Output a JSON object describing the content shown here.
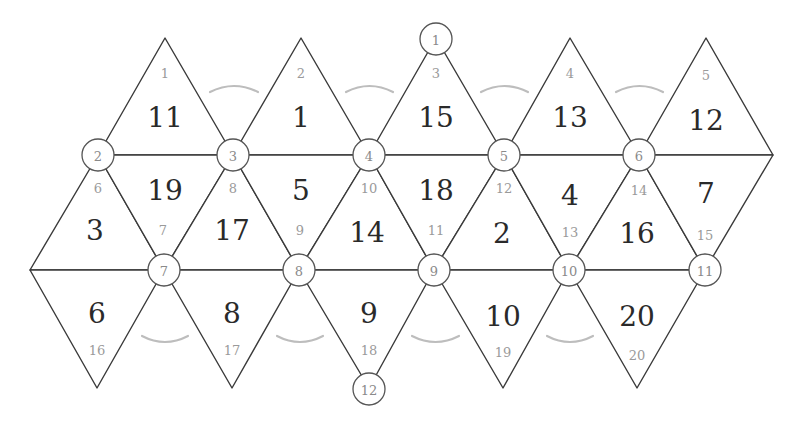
{
  "colors": {
    "edge": "#3a3a3a",
    "arc": "#bdbdbd",
    "face_label": "#2a2a2a",
    "index_label": "#9a9a9a",
    "vertex_label": "#8a8a8a"
  },
  "faces": [
    {
      "index": "1",
      "value": "11"
    },
    {
      "index": "2",
      "value": "1"
    },
    {
      "index": "3",
      "value": "15"
    },
    {
      "index": "4",
      "value": "13"
    },
    {
      "index": "5",
      "value": "12"
    },
    {
      "index": "6",
      "value": "3"
    },
    {
      "index": "7",
      "value": "19"
    },
    {
      "index": "8",
      "value": "17"
    },
    {
      "index": "9",
      "value": "5"
    },
    {
      "index": "10",
      "value": "14"
    },
    {
      "index": "11",
      "value": "18"
    },
    {
      "index": "12",
      "value": "2"
    },
    {
      "index": "13",
      "value": "4"
    },
    {
      "index": "14",
      "value": "16"
    },
    {
      "index": "15",
      "value": "7"
    },
    {
      "index": "16",
      "value": "6"
    },
    {
      "index": "17",
      "value": "8"
    },
    {
      "index": "18",
      "value": "9"
    },
    {
      "index": "19",
      "value": "10"
    },
    {
      "index": "20",
      "value": "20"
    }
  ],
  "vertices": [
    "1",
    "2",
    "3",
    "4",
    "5",
    "6",
    "7",
    "8",
    "9",
    "10",
    "11",
    "12"
  ]
}
